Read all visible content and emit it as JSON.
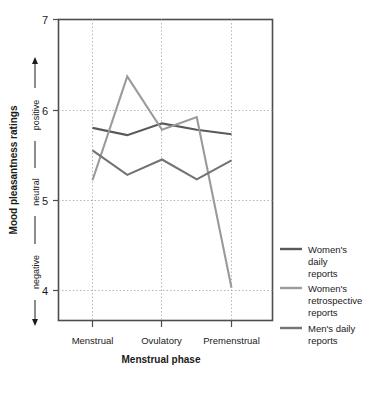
{
  "chart_data": {
    "type": "line",
    "title": "",
    "xlabel": "Menstrual phase",
    "ylabel": "Mood pleasantness ratings",
    "ylim": [
      4,
      7
    ],
    "yticks": [
      4,
      5,
      6,
      7
    ],
    "ytick_labels": [
      "4",
      "5",
      "6",
      "7"
    ],
    "grid": true,
    "grid_style": "dotted",
    "legend_position": "right",
    "x_positions": [
      1,
      2,
      3,
      4,
      5
    ],
    "categories": [
      "Menstrual",
      "",
      "Ovulatory",
      "",
      "Premenstrual"
    ],
    "category_labels": [
      "Menstrual",
      "Ovulatory",
      "Premenstrual"
    ],
    "y_scale_annotations": [
      "negative",
      "neutral",
      "positive"
    ],
    "series": [
      {
        "name": "Women's daily reports",
        "legend_lines": [
          "Women's",
          "daily",
          "reports"
        ],
        "color": "#595959",
        "values": [
          5.8,
          5.72,
          5.85,
          5.78,
          5.73
        ]
      },
      {
        "name": "Women's retrospective reports",
        "legend_lines": [
          "Women's",
          "retrospective",
          "reports"
        ],
        "color": "#9a9a9a",
        "values": [
          5.22,
          6.37,
          5.78,
          5.92,
          4.03
        ]
      },
      {
        "name": "Men's daily reports",
        "legend_lines": [
          "Men's daily",
          "reports"
        ],
        "color": "#737373",
        "values": [
          5.55,
          5.28,
          5.45,
          5.23,
          5.44
        ]
      }
    ]
  },
  "axes": {
    "y_title": "Mood pleasantness ratings",
    "x_title": "Menstrual phase",
    "y_tick_7": "7",
    "y_tick_6": "6",
    "y_tick_5": "5",
    "y_tick_4": "4",
    "scale_positive": "positive",
    "scale_neutral": "neutral",
    "scale_negative": "negative",
    "cat_1": "Menstrual",
    "cat_2": "Ovulatory",
    "cat_3": "Premenstrual"
  },
  "legend": {
    "items": [
      {
        "swatch_name": "legend-swatch-womens-daily",
        "line1": "Women's",
        "line2": "daily",
        "line3": "reports",
        "color": "#595959"
      },
      {
        "swatch_name": "legend-swatch-womens-retrospective",
        "line1": "Women's",
        "line2": "retrospective",
        "line3": "reports",
        "color": "#9a9a9a"
      },
      {
        "swatch_name": "legend-swatch-mens-daily",
        "line1": "Men's daily",
        "line2": "reports",
        "line3": "",
        "color": "#737373"
      }
    ]
  },
  "colors": {
    "frame": "#4d4d4d",
    "grid": "#b0b0b0",
    "text": "#1a1a1a",
    "background": "#ffffff"
  }
}
